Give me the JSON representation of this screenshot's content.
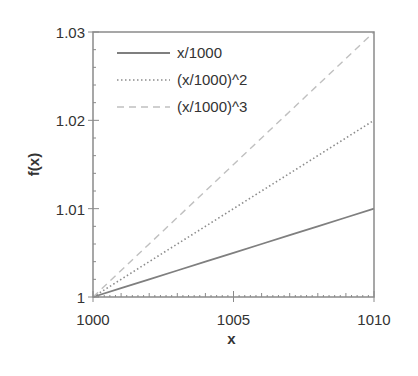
{
  "chart_data": {
    "type": "line",
    "title": "",
    "xlabel": "x",
    "ylabel": "f(x)",
    "xlim": [
      1000,
      1010
    ],
    "ylim": [
      1,
      1.03
    ],
    "x_ticks": [
      "1000",
      "1005",
      "1010"
    ],
    "y_ticks": [
      "1",
      "1.01",
      "1.02",
      "1.03"
    ],
    "grid": false,
    "legend_position": "upper left (inside)",
    "x": [
      1000,
      1001,
      1002,
      1003,
      1004,
      1005,
      1006,
      1007,
      1008,
      1009,
      1010
    ],
    "series": [
      {
        "name": "x/1000",
        "style": "solid",
        "color": "#7f7f7f",
        "values": [
          1.0,
          1.001,
          1.002,
          1.003,
          1.004,
          1.005,
          1.006,
          1.007,
          1.008,
          1.009,
          1.01
        ]
      },
      {
        "name": "(x/1000)^2",
        "style": "dotted",
        "color": "#8c8c8c",
        "values": [
          1.0,
          1.002,
          1.004,
          1.006,
          1.008,
          1.01,
          1.012,
          1.014,
          1.016,
          1.018,
          1.02
        ]
      },
      {
        "name": "(x/1000)^3",
        "style": "dashed",
        "color": "#c0c0c0",
        "values": [
          1.0,
          1.003,
          1.006,
          1.009,
          1.012,
          1.015,
          1.018,
          1.021,
          1.024,
          1.027,
          1.03
        ]
      }
    ]
  }
}
